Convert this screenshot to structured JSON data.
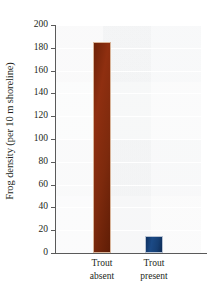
{
  "chart_data": {
    "type": "bar",
    "title": "",
    "xlabel": "",
    "ylabel": "Frog density (per 10 m shoreline)",
    "categories": [
      "Trout absent",
      "Trout present"
    ],
    "category_lines": [
      [
        "Trout",
        "absent"
      ],
      [
        "Trout",
        "present"
      ]
    ],
    "values": [
      185,
      15
    ],
    "ylim": [
      0,
      200
    ],
    "ytick_values": [
      0,
      20,
      40,
      60,
      80,
      100,
      120,
      140,
      160,
      180,
      200
    ],
    "ytick_labels": [
      "0",
      "20",
      "40",
      "60",
      "80",
      "100",
      "120",
      "140",
      "160",
      "180",
      "200"
    ],
    "grid": true,
    "legend": "none",
    "bar_colors": [
      "#7d2a0d",
      "#163f74"
    ],
    "plot_background": "#f2f3f4",
    "axis_color": "#5a5a5a",
    "text_color": "#231f20"
  }
}
